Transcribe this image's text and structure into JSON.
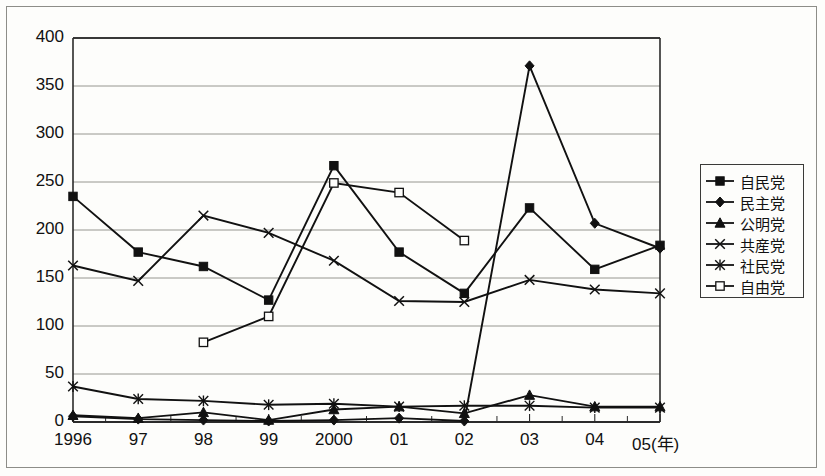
{
  "chart_data": {
    "type": "line",
    "title": "",
    "xlabel": "年",
    "ylabel": "",
    "ylim": [
      0,
      400
    ],
    "ytick_step": 50,
    "grid": true,
    "legend_position": "right",
    "categories": [
      "1996",
      "97",
      "98",
      "99",
      "2000",
      "01",
      "02",
      "03",
      "04",
      "05"
    ],
    "x_axis_unit_label": "05(年)",
    "y_ticks": [
      "0",
      "50",
      "100",
      "150",
      "200",
      "250",
      "300",
      "350",
      "400"
    ],
    "series": [
      {
        "name": "自民党",
        "marker": "filled-square",
        "values": [
          235,
          177,
          162,
          127,
          267,
          177,
          134,
          223,
          159,
          184
        ]
      },
      {
        "name": "民主党",
        "marker": "filled-diamond",
        "values": [
          6,
          3,
          2,
          1,
          2,
          4,
          1,
          371,
          207,
          181
        ]
      },
      {
        "name": "公明党",
        "marker": "filled-triangle",
        "values": [
          7,
          4,
          10,
          2,
          13,
          16,
          9,
          28,
          16,
          16
        ]
      },
      {
        "name": "共産党",
        "marker": "x-cross",
        "values": [
          163,
          147,
          215,
          197,
          168,
          126,
          125,
          148,
          138,
          134
        ]
      },
      {
        "name": "社民党",
        "marker": "asterisk",
        "values": [
          37,
          24,
          22,
          18,
          19,
          16,
          17,
          17,
          15,
          15
        ]
      },
      {
        "name": "自由党",
        "marker": "open-square",
        "values": [
          null,
          null,
          83,
          110,
          249,
          239,
          189,
          null,
          null,
          null
        ]
      }
    ]
  }
}
